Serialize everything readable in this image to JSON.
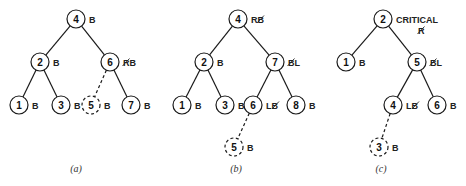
{
  "figures": [
    {
      "id": "a",
      "caption": "(a)",
      "caption_pos": [
        76,
        172
      ],
      "nodes": [
        {
          "key": "4",
          "x": 76,
          "y": 19,
          "label": "B",
          "struck": "",
          "dashed": false
        },
        {
          "key": "2",
          "x": 40,
          "y": 62,
          "label": "B",
          "struck": "",
          "dashed": false
        },
        {
          "key": "6",
          "x": 110,
          "y": 62,
          "label": "B",
          "struck": "R",
          "dashed": false
        },
        {
          "key": "1",
          "x": 19,
          "y": 105,
          "label": "B",
          "struck": "",
          "dashed": false
        },
        {
          "key": "3",
          "x": 61,
          "y": 105,
          "label": "B",
          "struck": "",
          "dashed": false
        },
        {
          "key": "5",
          "x": 91,
          "y": 105,
          "label": "B",
          "struck": "",
          "dashed": true
        },
        {
          "key": "7",
          "x": 131,
          "y": 105,
          "label": "B",
          "struck": "",
          "dashed": false
        }
      ],
      "edges": [
        {
          "from": "4",
          "to": "2",
          "dashed": false
        },
        {
          "from": "4",
          "to": "6",
          "dashed": false
        },
        {
          "from": "2",
          "to": "1",
          "dashed": false
        },
        {
          "from": "2",
          "to": "3",
          "dashed": false
        },
        {
          "from": "6",
          "to": "5",
          "dashed": true
        },
        {
          "from": "6",
          "to": "7",
          "dashed": false
        }
      ]
    },
    {
      "id": "b",
      "caption": "(b)",
      "caption_pos": [
        236,
        172
      ],
      "nodes": [
        {
          "key": "4",
          "x": 238,
          "y": 19,
          "label": "R",
          "struck": "B",
          "struck_after": true,
          "dashed": false
        },
        {
          "key": "2",
          "x": 204,
          "y": 62,
          "label": "B",
          "struck": "",
          "dashed": false
        },
        {
          "key": "7",
          "x": 275,
          "y": 62,
          "label": "L",
          "struck": "B",
          "dashed": false
        },
        {
          "key": "1",
          "x": 182,
          "y": 105,
          "label": "B",
          "struck": "",
          "dashed": false
        },
        {
          "key": "3",
          "x": 225,
          "y": 105,
          "label": "B",
          "struck": "",
          "dashed": false
        },
        {
          "key": "6",
          "x": 253,
          "y": 105,
          "label": "L",
          "struck": "B",
          "struck_after": true,
          "dashed": false
        },
        {
          "key": "8",
          "x": 296,
          "y": 105,
          "label": "B",
          "struck": "",
          "dashed": false
        },
        {
          "key": "5",
          "x": 234,
          "y": 147,
          "label": "B",
          "struck": "",
          "dashed": true
        }
      ],
      "edges": [
        {
          "from": "4",
          "to": "2",
          "dashed": false
        },
        {
          "from": "4",
          "to": "7",
          "dashed": false
        },
        {
          "from": "2",
          "to": "1",
          "dashed": false
        },
        {
          "from": "2",
          "to": "3",
          "dashed": false
        },
        {
          "from": "7",
          "to": "6",
          "dashed": false
        },
        {
          "from": "7",
          "to": "8",
          "dashed": false
        },
        {
          "from": "6",
          "to": "5",
          "dashed": true
        }
      ]
    },
    {
      "id": "c",
      "caption": "(c)",
      "caption_pos": [
        381,
        172
      ],
      "nodes": [
        {
          "key": "2",
          "x": 383,
          "y": 19,
          "label": "CRITICAL",
          "struck": "R",
          "struck_below": true,
          "dashed": false
        },
        {
          "key": "1",
          "x": 346,
          "y": 62,
          "label": "B",
          "struck": "",
          "dashed": false
        },
        {
          "key": "5",
          "x": 417,
          "y": 62,
          "label": "L",
          "struck": "B",
          "dashed": false
        },
        {
          "key": "4",
          "x": 393,
          "y": 105,
          "label": "L",
          "struck": "B",
          "struck_after": true,
          "dashed": false
        },
        {
          "key": "6",
          "x": 437,
          "y": 105,
          "label": "B",
          "struck": "",
          "dashed": false
        },
        {
          "key": "3",
          "x": 379,
          "y": 147,
          "label": "B",
          "struck": "",
          "dashed": true
        }
      ],
      "edges": [
        {
          "from": "2",
          "to": "1",
          "dashed": false
        },
        {
          "from": "2",
          "to": "5",
          "dashed": false
        },
        {
          "from": "5",
          "to": "4",
          "dashed": false
        },
        {
          "from": "5",
          "to": "6",
          "dashed": false
        },
        {
          "from": "4",
          "to": "3",
          "dashed": true
        }
      ]
    }
  ]
}
